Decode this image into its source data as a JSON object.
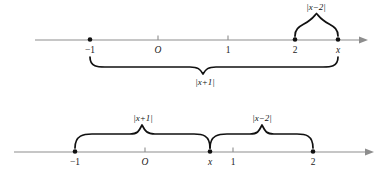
{
  "figure": {
    "background_color": "#ffffff",
    "axis_color": "#8d8d8d",
    "brace_color": "#111111",
    "label_color": "#222222"
  },
  "upper_diagram": {
    "name": "upper-number-line",
    "axis": {
      "y": 40,
      "x_start": 35,
      "x_end": 366,
      "arrow": "right"
    },
    "ticks": [
      {
        "label": "−1",
        "x": 90,
        "type": "point",
        "italic": false
      },
      {
        "label": "O",
        "x": 158,
        "type": "tick",
        "italic": true
      },
      {
        "label": "1",
        "x": 228,
        "type": "tick",
        "italic": false
      },
      {
        "label": "2",
        "x": 295,
        "type": "tick",
        "italic": false
      },
      {
        "label": "x",
        "x": 338,
        "type": "point",
        "italic": true
      }
    ],
    "braces": [
      {
        "name": "brace-x-minus-2",
        "label": "|x−2|",
        "from_x": 295,
        "to_x": 338,
        "direction": "up",
        "label_x": 316,
        "label_y": 10
      },
      {
        "name": "brace-x-plus-1",
        "label": "|x+1|",
        "from_x": 90,
        "to_x": 338,
        "direction": "down",
        "label_x": 205,
        "label_y": 87
      }
    ]
  },
  "lower_diagram": {
    "name": "lower-number-line",
    "axis": {
      "y": 152,
      "x_start": 14,
      "x_end": 372,
      "arrow": "right"
    },
    "ticks": [
      {
        "label": "−1",
        "x": 75,
        "type": "point",
        "italic": false
      },
      {
        "label": "O",
        "x": 145,
        "type": "tick",
        "italic": true
      },
      {
        "label": "x",
        "x": 210,
        "type": "point",
        "italic": true
      },
      {
        "label": "1",
        "x": 233,
        "type": "tick",
        "italic": false
      },
      {
        "label": "2",
        "x": 313,
        "type": "point",
        "italic": false
      }
    ],
    "braces": [
      {
        "name": "brace-x-plus-1",
        "label": "|x+1|",
        "from_x": 75,
        "to_x": 210,
        "direction": "up",
        "label_x": 143,
        "label_y": 113
      },
      {
        "name": "brace-x-minus-2",
        "label": "|x−2|",
        "from_x": 210,
        "to_x": 313,
        "direction": "up",
        "label_x": 262,
        "label_y": 113
      }
    ]
  }
}
